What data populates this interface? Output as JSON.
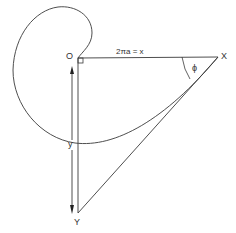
{
  "diagram": {
    "labels": {
      "origin": "O",
      "point_x": "X",
      "point_y": "Y",
      "horizontal_length": "2πa = x",
      "vertical_length": "y",
      "angle": "ϕ"
    },
    "colors": {
      "stroke": "#3a3a3a",
      "background": "#ffffff",
      "text": "#333333"
    },
    "points": {
      "O": [
        76,
        58
      ],
      "X": [
        218,
        57
      ],
      "Y": [
        77,
        212
      ]
    }
  }
}
